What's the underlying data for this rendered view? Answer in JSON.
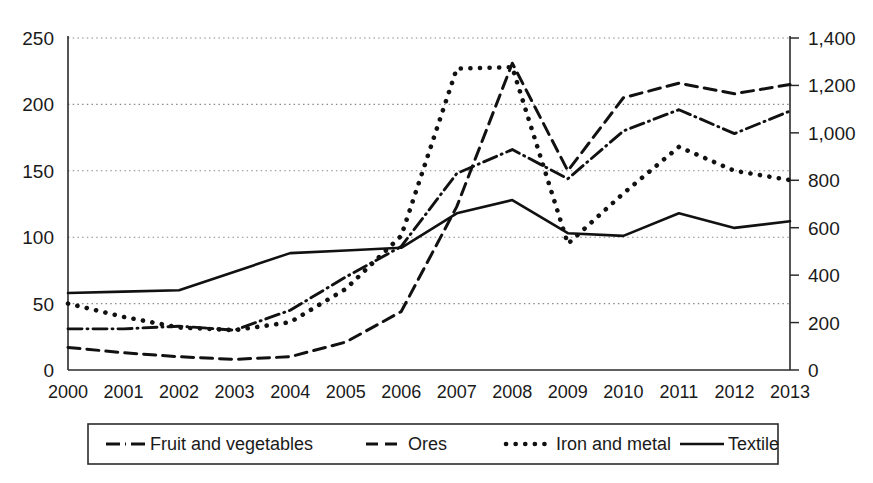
{
  "chart_data": {
    "type": "line",
    "title": "",
    "subtitle": "",
    "xlabel": "",
    "ylabel": "",
    "y2label": "",
    "grid": true,
    "legend_position": "bottom",
    "categories": [
      "2000",
      "2001",
      "2002",
      "2003",
      "2004",
      "2005",
      "2006",
      "2007",
      "2008",
      "2009",
      "2010",
      "2011",
      "2012",
      "2013"
    ],
    "x_tick_labels": [
      "2000",
      "2001",
      "2002",
      "2003",
      "2004",
      "2005",
      "2006",
      "2007",
      "2008",
      "2009",
      "2010",
      "2011",
      "2012",
      "2013"
    ],
    "y_tick_labels": [
      "0",
      "50",
      "100",
      "150",
      "200",
      "250"
    ],
    "y_tick_values": [
      0,
      50,
      100,
      150,
      200,
      250
    ],
    "ylim": [
      0,
      250
    ],
    "y2_tick_labels": [
      "0",
      "200",
      "400",
      "600",
      "800",
      "1,000",
      "1,200",
      "1,400"
    ],
    "y2_tick_values": [
      0,
      200,
      400,
      600,
      800,
      1000,
      1200,
      1400
    ],
    "y2lim": [
      0,
      1400
    ],
    "series": [
      {
        "name": "Fruit and vegetables",
        "axis": "left",
        "style": "dash-dot",
        "color": "#111111",
        "values": [
          31,
          31,
          33,
          30,
          45,
          70,
          93,
          148,
          166,
          144,
          180,
          196,
          178,
          195
        ]
      },
      {
        "name": "Ores",
        "axis": "left",
        "style": "dashed",
        "color": "#111111",
        "values": [
          17,
          13,
          10,
          8,
          10,
          21,
          44,
          123,
          231,
          150,
          205,
          216,
          208,
          215
        ]
      },
      {
        "name": "Iron and metal",
        "axis": "left",
        "style": "dotted",
        "color": "#111111",
        "values": [
          50,
          40,
          32,
          30,
          36,
          61,
          101,
          227,
          228,
          95,
          133,
          168,
          150,
          143
        ]
      },
      {
        "name": "Textile",
        "axis": "left",
        "style": "solid",
        "color": "#111111",
        "values": [
          58,
          59,
          60,
          74,
          88,
          90,
          92,
          118,
          128,
          103,
          101,
          118,
          107,
          112
        ]
      }
    ]
  },
  "legend": {
    "entries": [
      {
        "label": "Fruit and vegetables",
        "style": "dash-dot"
      },
      {
        "label": "Ores",
        "style": "dashed"
      },
      {
        "label": "Iron and metal",
        "style": "dotted"
      },
      {
        "label": "Textile",
        "style": "solid"
      }
    ]
  }
}
